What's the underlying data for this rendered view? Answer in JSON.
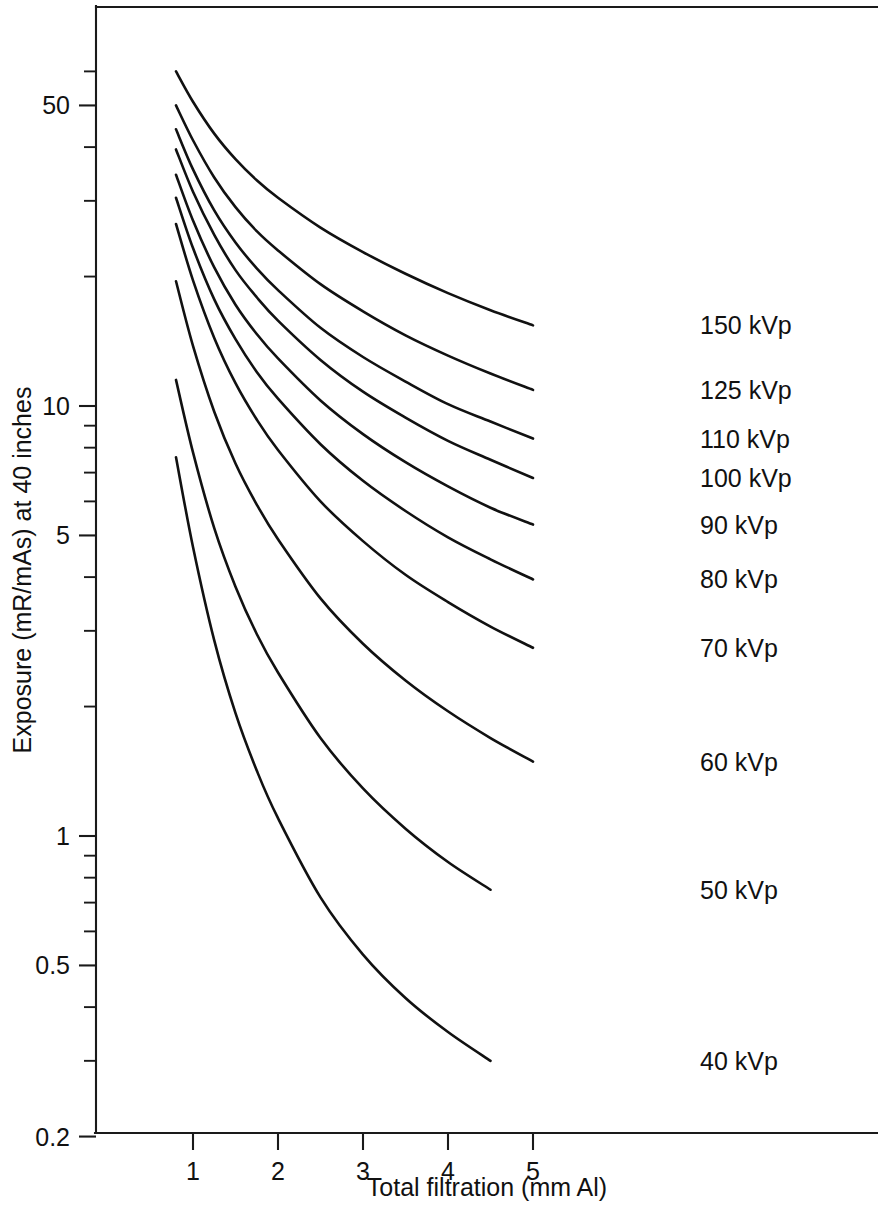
{
  "chart_data": {
    "type": "line",
    "title": "",
    "xlabel": "Total filtration (mm Al)",
    "ylabel": "Exposure (mR/mAs) at 40 inches",
    "xscale": "linear",
    "yscale": "log",
    "xlim": [
      0.2,
      6.2
    ],
    "ylim": [
      0.2,
      70
    ],
    "grid": false,
    "legend_position": "right-inline-labels",
    "x_ticks": [
      1,
      2,
      3,
      4,
      5
    ],
    "x_tick_labels": [
      "1",
      "2",
      "3",
      "4",
      "5"
    ],
    "y_ticks": [
      50,
      10,
      5,
      1,
      0.5,
      0.2
    ],
    "y_tick_labels": [
      "50",
      "10",
      "5",
      "1",
      "0.5",
      "0.2"
    ],
    "y_minor_ticks": [
      60,
      40,
      30,
      20,
      9,
      8,
      7,
      6,
      4,
      3,
      2,
      0.9,
      0.8,
      0.7,
      0.6,
      0.4,
      0.3
    ],
    "x_units": "mm Al",
    "y_units": "mR/mAs",
    "series": [
      {
        "name": "150 kVp",
        "label": "150 kVp",
        "x": [
          0.8,
          1.0,
          1.25,
          1.5,
          1.75,
          2.0,
          2.5,
          3.0,
          3.5,
          4.0,
          4.5,
          5.0
        ],
        "values": [
          60.0,
          51.0,
          43.0,
          37.5,
          33.5,
          30.5,
          26.0,
          22.8,
          20.3,
          18.3,
          16.7,
          15.4
        ]
      },
      {
        "name": "125 kVp",
        "label": "125 kVp",
        "x": [
          0.8,
          1.0,
          1.25,
          1.5,
          1.75,
          2.0,
          2.5,
          3.0,
          3.5,
          4.0,
          4.5,
          5.0
        ],
        "values": [
          50.0,
          41.5,
          34.0,
          29.0,
          25.5,
          23.0,
          19.2,
          16.6,
          14.6,
          13.1,
          11.9,
          10.9
        ]
      },
      {
        "name": "110 kVp",
        "label": "110 kVp",
        "x": [
          0.8,
          1.0,
          1.25,
          1.5,
          1.75,
          2.0,
          2.5,
          3.0,
          3.5,
          4.0,
          4.5,
          5.0
        ],
        "values": [
          44.0,
          35.5,
          28.5,
          24.0,
          20.9,
          18.6,
          15.2,
          13.0,
          11.4,
          10.1,
          9.2,
          8.4
        ]
      },
      {
        "name": "100 kVp",
        "label": "100 kVp",
        "x": [
          0.8,
          1.0,
          1.25,
          1.5,
          1.75,
          2.0,
          2.5,
          3.0,
          3.5,
          4.0,
          4.5,
          5.0
        ],
        "values": [
          39.5,
          31.5,
          25.0,
          20.7,
          17.9,
          15.8,
          12.8,
          10.8,
          9.4,
          8.3,
          7.5,
          6.8
        ]
      },
      {
        "name": "90 kVp",
        "label": "90 kVp",
        "x": [
          0.8,
          1.0,
          1.25,
          1.5,
          1.75,
          2.0,
          2.5,
          3.0,
          3.5,
          4.0,
          4.5,
          5.0
        ],
        "values": [
          34.5,
          27.0,
          21.0,
          17.2,
          14.7,
          12.9,
          10.3,
          8.6,
          7.4,
          6.5,
          5.8,
          5.3
        ]
      },
      {
        "name": "80 kVp",
        "label": "80 kVp",
        "x": [
          0.8,
          1.0,
          1.25,
          1.5,
          1.75,
          2.0,
          2.5,
          3.0,
          3.5,
          4.0,
          4.5,
          5.0
        ],
        "values": [
          30.5,
          23.3,
          17.7,
          14.3,
          12.0,
          10.4,
          8.15,
          6.7,
          5.7,
          4.95,
          4.4,
          3.95
        ]
      },
      {
        "name": "70 kVp",
        "label": "70 kVp",
        "x": [
          0.8,
          1.0,
          1.25,
          1.5,
          1.75,
          2.0,
          2.5,
          3.0,
          3.5,
          4.0,
          4.5,
          5.0
        ],
        "values": [
          26.5,
          19.6,
          14.4,
          11.3,
          9.3,
          7.9,
          6.0,
          4.85,
          4.05,
          3.5,
          3.07,
          2.74
        ]
      },
      {
        "name": "60 kVp",
        "label": "60 kVp",
        "x": [
          0.8,
          1.0,
          1.25,
          1.5,
          1.75,
          2.0,
          2.5,
          3.0,
          3.5,
          4.0,
          4.5,
          5.0
        ],
        "values": [
          19.5,
          13.8,
          9.7,
          7.35,
          5.9,
          4.9,
          3.57,
          2.8,
          2.3,
          1.95,
          1.69,
          1.49
        ]
      },
      {
        "name": "50 kVp",
        "label": "50 kVp",
        "x": [
          0.8,
          1.0,
          1.25,
          1.5,
          1.75,
          2.0,
          2.5,
          3.0,
          3.5,
          4.0,
          4.5
        ],
        "values": [
          11.5,
          7.8,
          5.2,
          3.8,
          2.95,
          2.4,
          1.69,
          1.29,
          1.04,
          0.87,
          0.75
        ]
      },
      {
        "name": "40 kVp",
        "label": "40 kVp",
        "x": [
          0.8,
          1.0,
          1.25,
          1.5,
          1.75,
          2.0,
          2.5,
          3.0,
          3.5,
          4.0,
          4.5
        ],
        "values": [
          7.6,
          4.7,
          2.85,
          1.93,
          1.42,
          1.1,
          0.72,
          0.53,
          0.42,
          0.35,
          0.3
        ]
      }
    ]
  },
  "axes": {
    "x_title": "Total filtration (mm Al)",
    "y_title": "Exposure (mR/mAs) at 40 inches"
  },
  "colors": {
    "curve": "#111111",
    "axis": "#1a1a1a",
    "background": "#ffffff"
  }
}
